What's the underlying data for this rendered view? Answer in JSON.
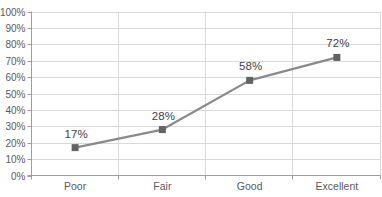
{
  "chart_data": {
    "type": "line",
    "title": "",
    "xlabel": "",
    "ylabel": "",
    "categories": [
      "Poor",
      "Fair",
      "Good",
      "Excellent"
    ],
    "values": [
      17,
      28,
      58,
      72
    ],
    "data_labels": [
      "17%",
      "28%",
      "58%",
      "72%"
    ],
    "y_tick_labels": [
      "0%",
      "10%",
      "20%",
      "30%",
      "40%",
      "50%",
      "60%",
      "70%",
      "80%",
      "90%",
      "100%"
    ],
    "ylim": [
      0,
      100
    ],
    "grid": true,
    "vertical_grid": true,
    "legend": "none",
    "marker_shape": "square",
    "colors": {
      "background": "#ffffff",
      "gridline": "#d9d9d9",
      "axis_line": "#9d9d9d",
      "series_line": "#8a8a8a",
      "marker": "#636363",
      "data_label_text": "#3f3f3f",
      "axis_tick_text": "#595959"
    }
  }
}
